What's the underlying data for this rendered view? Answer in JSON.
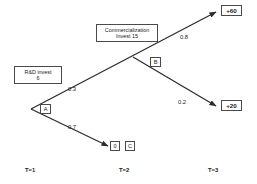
{
  "diagram": {
    "stroke_color": "#2b2b2b",
    "box_border_color": "#4a4a4a",
    "text_color": "#1a1a1a"
  },
  "nodes": {
    "rnd": {
      "name": "R&D invest",
      "line1": "R&D invest",
      "line2": "6"
    },
    "commercialization": {
      "line1": "Commercialization",
      "line2": "Invest   15"
    },
    "decision_a": {
      "label": "A"
    },
    "decision_b": {
      "label": "B"
    },
    "zero_payoff": {
      "label": "0"
    },
    "node_c": {
      "label": "C"
    }
  },
  "terminals": {
    "top": {
      "label": "+60"
    },
    "bottom": {
      "label": "+20"
    }
  },
  "edges": {
    "a_up": {
      "probability": "0.3"
    },
    "a_down": {
      "probability": "0.7"
    },
    "b_up": {
      "probability": "0.8"
    },
    "b_down": {
      "probability": "0.2"
    }
  },
  "timeline": {
    "t1": "T=1",
    "t2": "T=2",
    "t3": "T=3"
  }
}
